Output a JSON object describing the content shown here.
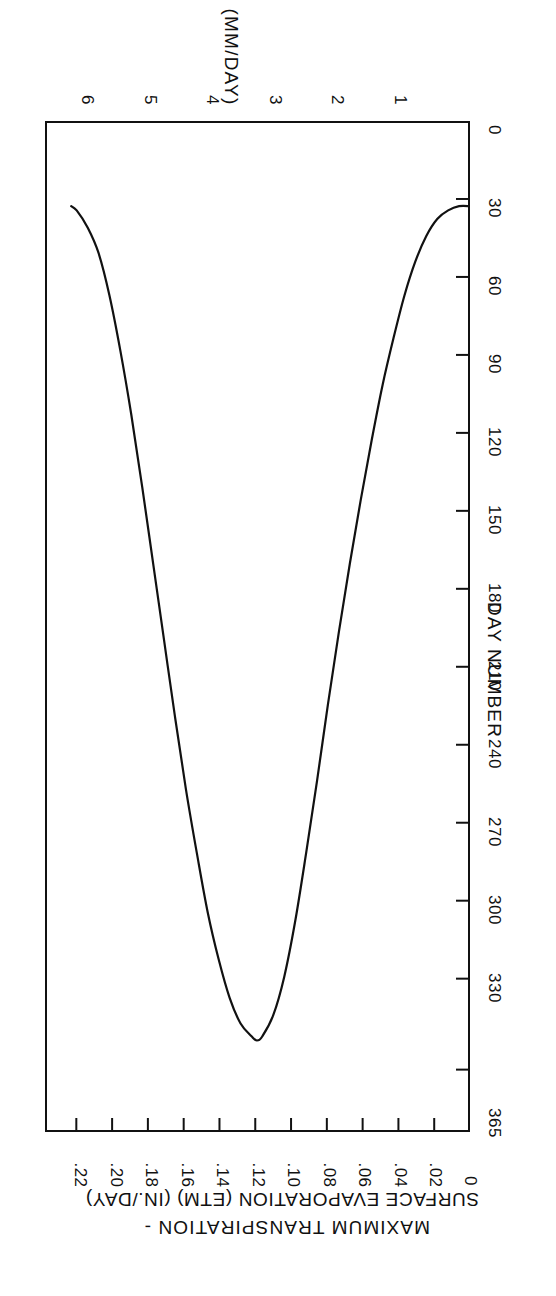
{
  "figure": {
    "orientation_note": "rotated-180",
    "background_color": "#ffffff",
    "line_color": "#111111"
  },
  "axes": {
    "value_axis": {
      "title": "MAXIMUM TRANSPIRATION -",
      "title_line2": "SURFACE EVAPORATION (ETM) (IN./DAY)",
      "ticks": [
        "0",
        ".02",
        ".04",
        ".06",
        ".08",
        ".10",
        ".12",
        ".14",
        ".16",
        ".18",
        ".20",
        ".22"
      ],
      "values": [
        0,
        0.02,
        0.04,
        0.06,
        0.08,
        0.1,
        0.12,
        0.14,
        0.16,
        0.18,
        0.2,
        0.22
      ],
      "min": 0,
      "max": 0.2375
    },
    "secondary_value_axis": {
      "title": "(MM/DAY)",
      "ticks": [
        "1",
        "2",
        "3",
        "4",
        "5",
        "6"
      ],
      "values": [
        1,
        2,
        3,
        4,
        5,
        6
      ],
      "min": 0,
      "max": 6.0
    },
    "day_axis": {
      "title": "DAY NUMBER",
      "ticks": [
        "0",
        "30",
        "60",
        "90",
        "120",
        "150",
        "180",
        "210",
        "240",
        "270",
        "300",
        "330",
        "365"
      ],
      "values": [
        0,
        30,
        60,
        90,
        120,
        150,
        180,
        210,
        240,
        270,
        300,
        330,
        365
      ],
      "min": 0,
      "max": 389
    }
  },
  "chart_data": {
    "type": "line",
    "title": "MAXIMUM TRANSPIRATION - SURFACE EVAPORATION (ETM) (IN./DAY)",
    "subtitle": "(MM/DAY)",
    "xlabel": "DAY NUMBER",
    "ylabel": "MAXIMUM TRANSPIRATION - SURFACE EVAPORATION (ETM) (IN./DAY)",
    "y2label": "(MM/DAY)",
    "xlim": [
      0,
      389
    ],
    "ylim": [
      0,
      0.2375
    ],
    "y2lim": [
      0,
      6.0
    ],
    "grid": false,
    "legend": null,
    "xticks": [
      0,
      30,
      60,
      90,
      120,
      150,
      180,
      210,
      240,
      270,
      300,
      330,
      365
    ],
    "xticklabels": [
      "0",
      "30",
      "60",
      "90",
      "120",
      "150",
      "180",
      "210",
      "240",
      "270",
      "300",
      "330",
      "365"
    ],
    "yticks": [
      0,
      0.02,
      0.04,
      0.06,
      0.08,
      0.1,
      0.12,
      0.14,
      0.16,
      0.18,
      0.2,
      0.22
    ],
    "yticklabels": [
      "0",
      ".02",
      ".04",
      ".06",
      ".08",
      ".10",
      ".12",
      ".14",
      ".16",
      ".18",
      ".20",
      ".22"
    ],
    "y2ticks": [
      1,
      2,
      3,
      4,
      5,
      6
    ],
    "y2ticklabels": [
      "1",
      "2",
      "3",
      "4",
      "5",
      "6"
    ],
    "series": [
      {
        "name": "ETM",
        "x": [
          0,
          10,
          20,
          30,
          40,
          50,
          60,
          70,
          80,
          90,
          100,
          110,
          120,
          130,
          140,
          150,
          160,
          170,
          180,
          190,
          195,
          200,
          210,
          220,
          230,
          240,
          250,
          260,
          270,
          280,
          290,
          300,
          310,
          320,
          330,
          340,
          350,
          360,
          365
        ],
        "y": [
          0.02,
          0.02,
          0.021,
          0.023,
          0.027,
          0.033,
          0.041,
          0.051,
          0.062,
          0.075,
          0.089,
          0.104,
          0.12,
          0.137,
          0.155,
          0.172,
          0.188,
          0.201,
          0.21,
          0.215,
          0.216,
          0.215,
          0.212,
          0.206,
          0.197,
          0.186,
          0.172,
          0.157,
          0.14,
          0.122,
          0.104,
          0.086,
          0.069,
          0.054,
          0.041,
          0.031,
          0.025,
          0.021,
          0.02
        ]
      }
    ],
    "peak": {
      "day": 195,
      "value_in_per_day": 0.216,
      "value_mm_per_day": 5.49
    },
    "minimum": {
      "day": 0,
      "value_in_per_day": 0.02,
      "value_mm_per_day": 0.51
    }
  }
}
